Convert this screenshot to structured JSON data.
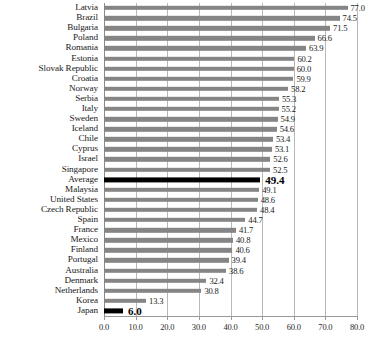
{
  "chart_data": {
    "type": "bar",
    "orientation": "horizontal",
    "title": "",
    "subtitle": "",
    "xlabel": "",
    "ylabel": "",
    "xlim": [
      0.0,
      80.0
    ],
    "xticks": [
      "0.0",
      "10.0",
      "20.0",
      "30.0",
      "40.0",
      "50.0",
      "60.0",
      "70.0",
      "80.0"
    ],
    "xtick_values": [
      0,
      10,
      20,
      30,
      40,
      50,
      60,
      70,
      80
    ],
    "grid": true,
    "legend": "none",
    "bar_color": "#858585",
    "highlight_color": "#000000",
    "categories": [
      "Latvia",
      "Brazil",
      "Bulgaria",
      "Poland",
      "Romania",
      "Estonia",
      "Slovak Republic",
      "Croatia",
      "Norway",
      "Serbia",
      "Italy",
      "Sweden",
      "Iceland",
      "Chile",
      "Cyprus",
      "Israel",
      "Singapore",
      "Average",
      "Malaysia",
      "United States",
      "Czech Republic",
      "Spain",
      "France",
      "Mexico",
      "Finland",
      "Portugal",
      "Australia",
      "Denmark",
      "Netherlands",
      "Korea",
      "Japan"
    ],
    "values": [
      77.0,
      74.5,
      71.5,
      66.6,
      63.9,
      60.2,
      60.0,
      59.9,
      58.2,
      55.3,
      55.2,
      54.9,
      54.6,
      53.4,
      53.1,
      52.6,
      52.5,
      49.4,
      49.1,
      48.6,
      48.4,
      44.7,
      41.7,
      40.8,
      40.6,
      39.4,
      38.6,
      32.4,
      30.8,
      13.3,
      6.0
    ],
    "value_labels": [
      "77.0",
      "74.5",
      "71.5",
      "66.6",
      "63.9",
      "60.2",
      "60.0",
      "59.9",
      "58.2",
      "55.3",
      "55.2",
      "54.9",
      "54.6",
      "53.4",
      "53.1",
      "52.6",
      "52.5",
      "49.4",
      "49.1",
      "48.6",
      "48.4",
      "44.7",
      "41.7",
      "40.8",
      "40.6",
      "39.4",
      "38.6",
      "32.4",
      "30.8",
      "13.3",
      "6.0"
    ],
    "highlighted": [
      "Average",
      "Japan"
    ]
  }
}
